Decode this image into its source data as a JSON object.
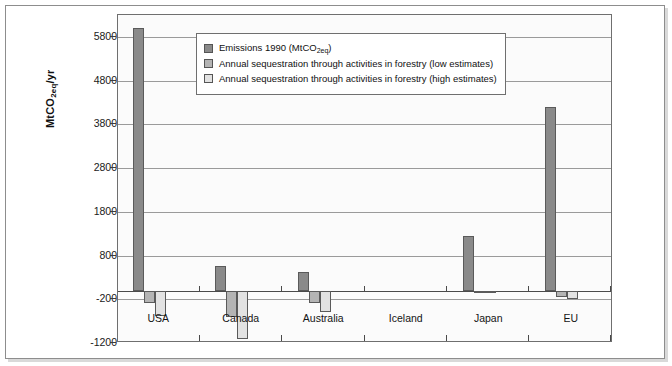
{
  "chart_data": {
    "type": "bar",
    "title": "",
    "subtitle": "",
    "xlabel": "",
    "ylabel": "MtCO2eq/yr",
    "ylabel_parts": {
      "pre": "MtCO",
      "sub": "2eq",
      "post": "/yr"
    },
    "categories": [
      "USA",
      "Canada",
      "Australia",
      "Iceland",
      "Japan",
      "EU"
    ],
    "series": [
      {
        "name": "Emissions 1990 (MtCO2eq)",
        "name_parts": {
          "pre": "Emissions 1990 (MtCO",
          "sub": "2eq",
          "post": ")"
        },
        "color": "#8a8a8a",
        "values": [
          6000,
          560,
          420,
          0,
          1250,
          4200
        ]
      },
      {
        "name": "Annual sequestration through activities in forestry (low estimates)",
        "color": "#b4b4b4",
        "values": [
          -280,
          -600,
          -280,
          0,
          -30,
          -150
        ]
      },
      {
        "name": "Annual sequestration through activities in forestry (high estimates)",
        "color": "#e2e2e2",
        "values": [
          -580,
          -1120,
          -500,
          0,
          -60,
          -200
        ]
      }
    ],
    "yticks": [
      5800,
      4800,
      3800,
      2800,
      1800,
      800,
      -200,
      -1200
    ],
    "ytick_labels": [
      "5800",
      "4800",
      "3800",
      "2800",
      "1800",
      "800",
      "-200",
      "-1200"
    ],
    "ylim": [
      -1200,
      6300
    ],
    "grid": true,
    "legend_position": "top-center-inside",
    "colors": {
      "emissions": "#8a8a8a",
      "low_estimate": "#b4b4b4",
      "high_estimate": "#e2e2e2",
      "gridline": "#9a9a9a",
      "axis": "#4a4a4a",
      "frame": "#8d8d8d",
      "plot_background": "#fbfbfb",
      "text": "#111111"
    }
  }
}
